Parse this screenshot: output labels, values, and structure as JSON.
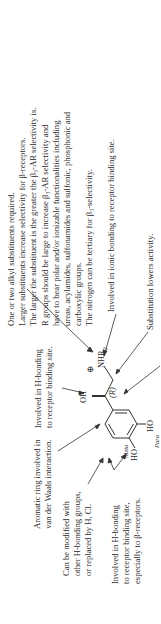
{
  "figure": {
    "structure": {
      "oh_label": "OH",
      "nhr_label": "NHR",
      "nhr_sub": "2",
      "charge_symbol": "⊕",
      "stereo_label": "(R)",
      "meta_ho": "HO",
      "meta_label": "Meta",
      "para_ho": "HO",
      "para_label": "Para"
    },
    "annotations": {
      "amine_substituents": [
        "One or two alkyl substituents required.",
        "Larger substituents increase selectivity for β-receptors.",
        "The larger the substituent is the greater the β₃-AR selectivity is.",
        "R groups should be large to increase β₃-AR selectivity and",
        "have to bear polar and/or ionizable functionalities including",
        "ureas, acylamides, sulfonamides and sulfonic, phosphonic and",
        "carboxylic groups.",
        "The nitrogen can be tertiary for β₃-selectivity."
      ],
      "ionic_bonding": "Involved in ionic bonding to receptor binding site.",
      "substitution": "Substitution lowers activity.",
      "hydroxyl_hbond": [
        "Involved in H-bonding",
        "to receptor binding site."
      ],
      "aromatic_ring": [
        "Aromatic ring involved in",
        "van der Waals interaction."
      ],
      "meta_modification": [
        "Can be modified with",
        "other H-bonding groups,",
        "or replaced by H, Cl."
      ],
      "phenol_hbond": [
        "Involved in H-bonding",
        "to receptor binding site,",
        "especially to β-receptors."
      ]
    }
  }
}
